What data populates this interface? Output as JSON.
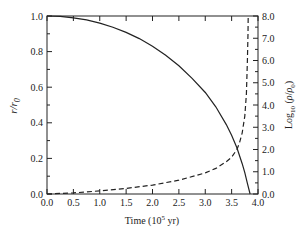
{
  "chart_data": {
    "type": "line",
    "title": "",
    "xlabel": "Time (10^5 yr)",
    "xlabel_parts": {
      "pre": "Time (10",
      "sup": "5",
      "post": " yr)"
    },
    "ylabel_left": "r/r0",
    "ylabel_right": "Log10 (rho/rho0)",
    "xlim": [
      0.0,
      4.0
    ],
    "ylim_left": [
      0.0,
      1.0
    ],
    "ylim_right": [
      0.0,
      8.0
    ],
    "x_ticks": [
      "0.0",
      "0.5",
      "1.0",
      "1.5",
      "2.0",
      "2.5",
      "3.0",
      "3.5",
      "4.0"
    ],
    "y_left_ticks": [
      "0.0",
      "0.2",
      "0.4",
      "0.6",
      "0.8",
      "1.0"
    ],
    "y_right_ticks": [
      "0.0",
      "1.0",
      "2.0",
      "3.0",
      "4.0",
      "5.0",
      "6.0",
      "7.0",
      "8.0"
    ],
    "grid": false,
    "legend": "none",
    "series": [
      {
        "name": "r/r0",
        "axis": "left",
        "style": "solid",
        "x": [
          0.0,
          0.25,
          0.5,
          0.75,
          1.0,
          1.25,
          1.5,
          1.75,
          2.0,
          2.25,
          2.5,
          2.75,
          3.0,
          3.2,
          3.4,
          3.5,
          3.6,
          3.7,
          3.75,
          3.8,
          3.85
        ],
        "y": [
          1.0,
          0.998,
          0.99,
          0.978,
          0.96,
          0.937,
          0.908,
          0.873,
          0.83,
          0.78,
          0.72,
          0.65,
          0.57,
          0.49,
          0.39,
          0.33,
          0.26,
          0.17,
          0.12,
          0.06,
          0.0
        ]
      },
      {
        "name": "Log10(rho/rho0)",
        "axis": "right",
        "style": "dashed",
        "x": [
          0.0,
          0.5,
          1.0,
          1.5,
          2.0,
          2.5,
          3.0,
          3.2,
          3.4,
          3.5,
          3.6,
          3.65,
          3.7,
          3.75,
          3.78,
          3.8,
          3.81,
          3.815
        ],
        "y": [
          0.0,
          0.05,
          0.14,
          0.25,
          0.4,
          0.62,
          0.95,
          1.15,
          1.45,
          1.65,
          2.0,
          2.3,
          2.75,
          3.5,
          4.5,
          6.0,
          7.2,
          8.0
        ]
      }
    ]
  }
}
